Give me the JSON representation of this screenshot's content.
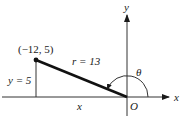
{
  "diagram": {
    "point_label": "(−12, 5)",
    "radius_label": "r = 13",
    "height_label": "y = 5",
    "base_label": "x",
    "origin_label": "O",
    "x_axis_label": "x",
    "y_axis_label": "y",
    "angle_label": "θ",
    "point": {
      "x": -12,
      "y": 5
    },
    "r": 13,
    "colors": {
      "line": "#1a1a1a",
      "axis": "#333333",
      "background": "#ffffff"
    }
  }
}
